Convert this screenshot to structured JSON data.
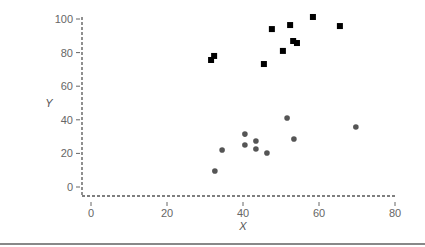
{
  "chart_data": {
    "type": "scatter",
    "title": "",
    "xlabel": "X",
    "ylabel": "Y",
    "xlim": [
      -3,
      80
    ],
    "ylim": [
      -3,
      102
    ],
    "x_ticks": [
      0,
      20,
      40,
      60,
      80
    ],
    "y_ticks": [
      0,
      20,
      40,
      60,
      80,
      100
    ],
    "grid": false,
    "legend": null,
    "series": [
      {
        "name": "squares",
        "marker": "square",
        "color": "#000000",
        "points": [
          {
            "x": 31.6,
            "y": 75.6
          },
          {
            "x": 32.4,
            "y": 78.0
          },
          {
            "x": 45.5,
            "y": 73.2
          },
          {
            "x": 47.6,
            "y": 94.0
          },
          {
            "x": 50.5,
            "y": 81.0
          },
          {
            "x": 52.4,
            "y": 96.4
          },
          {
            "x": 53.2,
            "y": 86.9
          },
          {
            "x": 54.2,
            "y": 85.7
          },
          {
            "x": 58.4,
            "y": 101.2
          },
          {
            "x": 65.5,
            "y": 95.8
          }
        ]
      },
      {
        "name": "circles",
        "marker": "circle",
        "color": "#555555",
        "points": [
          {
            "x": 32.6,
            "y": 9.5
          },
          {
            "x": 34.5,
            "y": 22.0
          },
          {
            "x": 40.5,
            "y": 31.5
          },
          {
            "x": 40.5,
            "y": 25.0
          },
          {
            "x": 43.4,
            "y": 27.4
          },
          {
            "x": 43.4,
            "y": 22.6
          },
          {
            "x": 46.3,
            "y": 20.2
          },
          {
            "x": 51.6,
            "y": 41.1
          },
          {
            "x": 53.4,
            "y": 28.6
          },
          {
            "x": 69.7,
            "y": 35.7
          }
        ]
      }
    ]
  },
  "layout": {
    "x0_px": 91,
    "px_per_x": 3.8,
    "y0_px": 187,
    "px_per_y": 1.68,
    "axis_left_px": 82,
    "axis_bottom_px": 196,
    "axis_right_px": 395,
    "axis_top_px": 17
  }
}
